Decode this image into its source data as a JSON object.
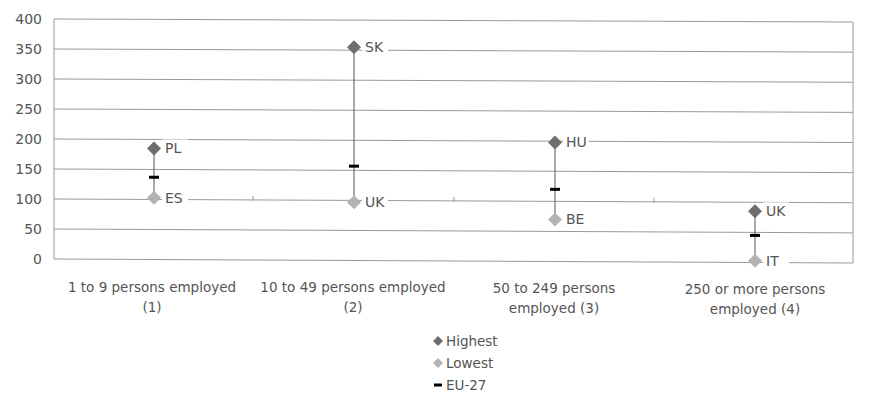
{
  "chart_data": {
    "type": "scatter",
    "subtype": "high-low range with EU average marker",
    "title": "",
    "xlabel": "",
    "ylabel": "",
    "ylim": [
      0,
      400
    ],
    "yticks": [
      0,
      50,
      100,
      150,
      200,
      250,
      300,
      350,
      400
    ],
    "grid": true,
    "legend_position": "bottom",
    "categories": [
      "1 to 9 persons employed (1)",
      "10 to 49 persons employed (2)",
      "50 to 249 persons employed (3)",
      "250 or more persons employed (4)"
    ],
    "series": [
      {
        "name": "Highest",
        "values": [
          185,
          355,
          198,
          85
        ],
        "labels": [
          "PL",
          "SK",
          "HU",
          "UK"
        ],
        "color": "#6e6e6e",
        "marker": "diamond"
      },
      {
        "name": "Lowest",
        "values": [
          103,
          97,
          70,
          3
        ],
        "labels": [
          "ES",
          "UK",
          "BE",
          "IT"
        ],
        "color": "#b3b3b3",
        "marker": "diamond"
      },
      {
        "name": "EU-27",
        "values": [
          137,
          157,
          120,
          45
        ],
        "color": "#000000",
        "marker": "dash"
      }
    ]
  },
  "axis": {
    "y_ticks": [
      "0",
      "50",
      "100",
      "150",
      "200",
      "250",
      "300",
      "350",
      "400"
    ],
    "x_labels": [
      {
        "line1": "1 to 9 persons employed",
        "line2": "(1)"
      },
      {
        "line1": "10 to 49 persons employed",
        "line2": "(2)"
      },
      {
        "line1": "50 to 249 persons",
        "line2": "employed (3)"
      },
      {
        "line1": "250 or more persons",
        "line2": "employed (4)"
      }
    ]
  },
  "legend": {
    "items": [
      {
        "label": "Highest",
        "color": "#6e6e6e",
        "marker": "diamond-icon"
      },
      {
        "label": "Lowest",
        "color": "#b3b3b3",
        "marker": "diamond-icon"
      },
      {
        "label": "EU-27",
        "color": "#000000",
        "marker": "dash-icon"
      }
    ]
  }
}
